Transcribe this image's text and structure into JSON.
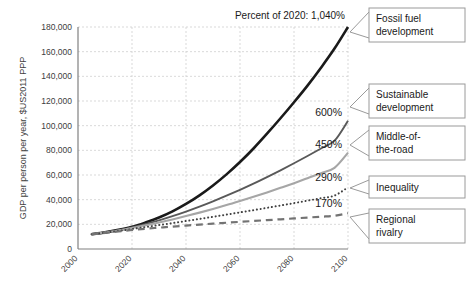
{
  "chart_data": {
    "type": "line",
    "title": "",
    "xlabel": "",
    "ylabel": "GDP per person per year, $US2011 PPP",
    "xlim": [
      2000,
      2100
    ],
    "ylim": [
      0,
      180000
    ],
    "grid": true,
    "legend_position": "right-callouts",
    "xticks": [
      "2000",
      "2020",
      "2040",
      "2060",
      "2080",
      "2100"
    ],
    "xtick_values": [
      2000,
      2020,
      2040,
      2060,
      2080,
      2100
    ],
    "yticks": [
      "0",
      "20,000",
      "40,000",
      "60,000",
      "80,000",
      "100,000",
      "120,000",
      "140,000",
      "160,000",
      "180,000"
    ],
    "ytick_values": [
      0,
      20000,
      40000,
      60000,
      80000,
      100000,
      120000,
      140000,
      160000,
      180000
    ],
    "annotation": "Percent of 2020: 1,040%",
    "x": [
      2005,
      2010,
      2015,
      2020,
      2025,
      2030,
      2035,
      2040,
      2045,
      2050,
      2055,
      2060,
      2065,
      2070,
      2075,
      2080,
      2085,
      2090,
      2095,
      2100
    ],
    "series": [
      {
        "name": "Fossil fuel development",
        "percent_of_2020": "1,040%",
        "style": "solid",
        "color": "#1a1a1a",
        "width": 2.6,
        "values": [
          12000,
          13500,
          15500,
          18000,
          21500,
          25500,
          30500,
          36500,
          43500,
          51500,
          60500,
          70500,
          81500,
          93500,
          106000,
          119000,
          132500,
          147000,
          162500,
          180000
        ]
      },
      {
        "name": "Sustainable development",
        "percent_of_2020": "600%",
        "style": "solid",
        "color": "#595959",
        "width": 1.9,
        "values": [
          12000,
          13500,
          15200,
          17500,
          20200,
          23200,
          26600,
          30300,
          34300,
          38600,
          43200,
          48000,
          53000,
          58300,
          63800,
          69500,
          75400,
          81500,
          87800,
          104000
        ]
      },
      {
        "name": "Middle-of-the-road",
        "percent_of_2020": "450%",
        "style": "solid",
        "color": "#a6a6a6",
        "width": 2.1,
        "values": [
          12000,
          13400,
          15000,
          17000,
          19200,
          21500,
          24000,
          26700,
          29500,
          32500,
          35600,
          38900,
          42300,
          45900,
          49600,
          53400,
          57400,
          61500,
          65800,
          78000
        ]
      },
      {
        "name": "Inequality",
        "percent_of_2020": "290%",
        "style": "dotted",
        "color": "#404040",
        "width": 2.0,
        "values": [
          12000,
          13200,
          14600,
          16200,
          17800,
          19400,
          21000,
          22700,
          24400,
          26100,
          27900,
          29700,
          31500,
          33400,
          35300,
          37200,
          39200,
          41200,
          43300,
          50000
        ]
      },
      {
        "name": "Regional rivalry",
        "percent_of_2020": "170%",
        "style": "dashed",
        "color": "#737373",
        "width": 2.2,
        "values": [
          12000,
          13000,
          14200,
          15400,
          16400,
          17300,
          18200,
          19000,
          19800,
          20600,
          21300,
          22000,
          22700,
          23400,
          24100,
          24800,
          25500,
          26200,
          26900,
          29000
        ]
      }
    ],
    "callouts": [
      {
        "label_line1": "Fossil fuel",
        "label_line2": "development"
      },
      {
        "label_line1": "Sustainable",
        "label_line2": "development"
      },
      {
        "label_line1": "Middle-of-",
        "label_line2": "the-road"
      },
      {
        "label_line1": "Inequality",
        "label_line2": ""
      },
      {
        "label_line1": "Regional",
        "label_line2": "rivalry"
      }
    ]
  }
}
